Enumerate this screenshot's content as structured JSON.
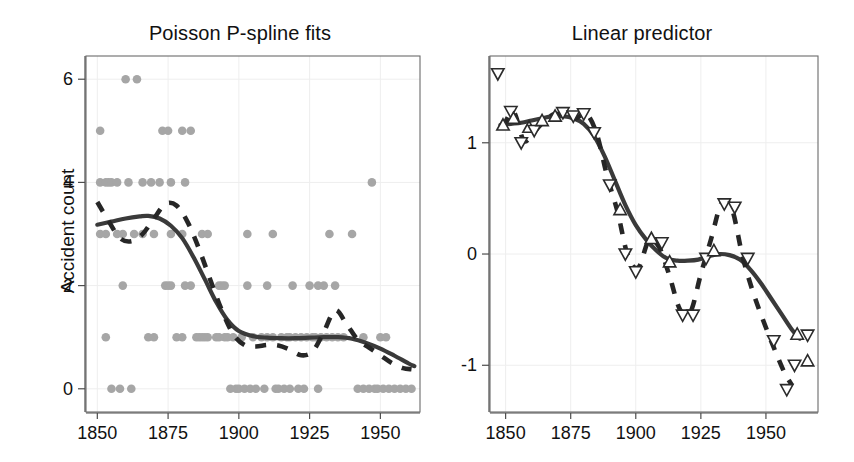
{
  "figure": {
    "background": "#ffffff",
    "dot_color": "#a6a6a6",
    "solid_color": "#3a3a3a",
    "dashed_color": "#262626",
    "grid_color": "#eeeeee"
  },
  "panels": [
    {
      "id": "left",
      "title": "Poisson P-spline fits",
      "ylabel": "Accident count",
      "xlabel": "",
      "xticks": [
        1850,
        1875,
        1900,
        1925,
        1950
      ],
      "yticks": [
        0,
        2,
        4,
        6
      ],
      "xlim": [
        1846,
        1964
      ],
      "ylim": [
        -0.45,
        6.45
      ]
    },
    {
      "id": "right",
      "title": "Linear predictor",
      "ylabel": "",
      "xlabel": "",
      "xticks": [
        1850,
        1875,
        1900,
        1925,
        1950
      ],
      "yticks": [
        -1,
        0,
        1
      ],
      "xlim": [
        1844,
        1970
      ],
      "ylim": [
        -1.42,
        1.78
      ]
    }
  ],
  "chart_data": [
    {
      "type": "scatter",
      "panel": "left",
      "title": "Poisson P-spline fits",
      "xlabel": "",
      "ylabel": "Accident count",
      "xlim": [
        1846,
        1964
      ],
      "ylim": [
        -0.45,
        6.45
      ],
      "xticks": [
        1850,
        1875,
        1900,
        1925,
        1950
      ],
      "yticks": [
        0,
        2,
        4,
        6
      ],
      "grid": true,
      "legend": "none",
      "points": [
        {
          "x": 1851,
          "y": 4
        },
        {
          "x": 1853,
          "y": 4
        },
        {
          "x": 1854,
          "y": 4
        },
        {
          "x": 1855,
          "y": 4
        },
        {
          "x": 1857,
          "y": 4
        },
        {
          "x": 1861,
          "y": 4
        },
        {
          "x": 1866,
          "y": 4
        },
        {
          "x": 1869,
          "y": 4
        },
        {
          "x": 1872,
          "y": 4
        },
        {
          "x": 1876,
          "y": 4
        },
        {
          "x": 1881,
          "y": 4
        },
        {
          "x": 1947,
          "y": 4
        },
        {
          "x": 1851,
          "y": 5
        },
        {
          "x": 1873,
          "y": 5
        },
        {
          "x": 1875,
          "y": 5
        },
        {
          "x": 1880,
          "y": 5
        },
        {
          "x": 1883,
          "y": 5
        },
        {
          "x": 1860,
          "y": 6
        },
        {
          "x": 1864,
          "y": 6
        },
        {
          "x": 1851,
          "y": 3
        },
        {
          "x": 1853,
          "y": 3
        },
        {
          "x": 1857,
          "y": 3
        },
        {
          "x": 1859,
          "y": 3
        },
        {
          "x": 1863,
          "y": 3
        },
        {
          "x": 1866,
          "y": 3
        },
        {
          "x": 1870,
          "y": 3
        },
        {
          "x": 1876,
          "y": 3
        },
        {
          "x": 1880,
          "y": 3
        },
        {
          "x": 1887,
          "y": 3
        },
        {
          "x": 1889,
          "y": 3
        },
        {
          "x": 1903,
          "y": 3
        },
        {
          "x": 1912,
          "y": 3
        },
        {
          "x": 1932,
          "y": 3
        },
        {
          "x": 1940,
          "y": 3
        },
        {
          "x": 1859,
          "y": 2
        },
        {
          "x": 1874,
          "y": 2
        },
        {
          "x": 1875,
          "y": 2
        },
        {
          "x": 1876,
          "y": 2
        },
        {
          "x": 1881,
          "y": 2
        },
        {
          "x": 1883,
          "y": 2
        },
        {
          "x": 1893,
          "y": 2
        },
        {
          "x": 1894,
          "y": 2
        },
        {
          "x": 1895,
          "y": 2
        },
        {
          "x": 1903,
          "y": 2
        },
        {
          "x": 1910,
          "y": 2
        },
        {
          "x": 1919,
          "y": 2
        },
        {
          "x": 1925,
          "y": 2
        },
        {
          "x": 1928,
          "y": 2
        },
        {
          "x": 1930,
          "y": 2
        },
        {
          "x": 1934,
          "y": 2
        },
        {
          "x": 1853,
          "y": 1
        },
        {
          "x": 1868,
          "y": 1
        },
        {
          "x": 1870,
          "y": 1
        },
        {
          "x": 1878,
          "y": 1
        },
        {
          "x": 1880,
          "y": 1
        },
        {
          "x": 1885,
          "y": 1
        },
        {
          "x": 1886,
          "y": 1
        },
        {
          "x": 1887,
          "y": 1
        },
        {
          "x": 1888,
          "y": 1
        },
        {
          "x": 1889,
          "y": 1
        },
        {
          "x": 1892,
          "y": 1
        },
        {
          "x": 1893,
          "y": 1
        },
        {
          "x": 1895,
          "y": 1
        },
        {
          "x": 1896,
          "y": 1
        },
        {
          "x": 1898,
          "y": 1
        },
        {
          "x": 1901,
          "y": 1
        },
        {
          "x": 1905,
          "y": 1
        },
        {
          "x": 1908,
          "y": 1
        },
        {
          "x": 1910,
          "y": 1
        },
        {
          "x": 1912,
          "y": 1
        },
        {
          "x": 1915,
          "y": 1
        },
        {
          "x": 1917,
          "y": 1
        },
        {
          "x": 1918,
          "y": 1
        },
        {
          "x": 1920,
          "y": 1
        },
        {
          "x": 1922,
          "y": 1
        },
        {
          "x": 1924,
          "y": 1
        },
        {
          "x": 1926,
          "y": 1
        },
        {
          "x": 1927,
          "y": 1
        },
        {
          "x": 1929,
          "y": 1
        },
        {
          "x": 1931,
          "y": 1
        },
        {
          "x": 1933,
          "y": 1
        },
        {
          "x": 1935,
          "y": 1
        },
        {
          "x": 1937,
          "y": 1
        },
        {
          "x": 1944,
          "y": 1
        },
        {
          "x": 1950,
          "y": 1
        },
        {
          "x": 1952,
          "y": 1
        },
        {
          "x": 1855,
          "y": 0
        },
        {
          "x": 1858,
          "y": 0
        },
        {
          "x": 1862,
          "y": 0
        },
        {
          "x": 1897,
          "y": 0
        },
        {
          "x": 1899,
          "y": 0
        },
        {
          "x": 1900,
          "y": 0
        },
        {
          "x": 1902,
          "y": 0
        },
        {
          "x": 1904,
          "y": 0
        },
        {
          "x": 1906,
          "y": 0
        },
        {
          "x": 1909,
          "y": 0
        },
        {
          "x": 1913,
          "y": 0
        },
        {
          "x": 1914,
          "y": 0
        },
        {
          "x": 1916,
          "y": 0
        },
        {
          "x": 1918,
          "y": 0
        },
        {
          "x": 1921,
          "y": 0
        },
        {
          "x": 1923,
          "y": 0
        },
        {
          "x": 1928,
          "y": 0
        },
        {
          "x": 1942,
          "y": 0
        },
        {
          "x": 1944,
          "y": 0
        },
        {
          "x": 1946,
          "y": 0
        },
        {
          "x": 1948,
          "y": 0
        },
        {
          "x": 1949,
          "y": 0
        },
        {
          "x": 1951,
          "y": 0
        },
        {
          "x": 1953,
          "y": 0
        },
        {
          "x": 1955,
          "y": 0
        },
        {
          "x": 1957,
          "y": 0
        },
        {
          "x": 1959,
          "y": 0
        },
        {
          "x": 1961,
          "y": 0
        }
      ],
      "series": [
        {
          "name": "solid-fit",
          "style": "solid",
          "x": [
            1850,
            1855,
            1860,
            1865,
            1868,
            1872,
            1876,
            1880,
            1884,
            1888,
            1892,
            1896,
            1900,
            1905,
            1910,
            1915,
            1920,
            1925,
            1930,
            1935,
            1940,
            1945,
            1950,
            1955,
            1960,
            1962
          ],
          "y": [
            3.18,
            3.24,
            3.3,
            3.34,
            3.35,
            3.3,
            3.16,
            2.92,
            2.55,
            2.12,
            1.68,
            1.33,
            1.12,
            1.02,
            0.99,
            0.98,
            0.98,
            0.99,
            1.0,
            1.0,
            0.97,
            0.89,
            0.78,
            0.64,
            0.49,
            0.44
          ]
        },
        {
          "name": "dashed-fit",
          "style": "dashed",
          "x": [
            1850,
            1854,
            1858,
            1862,
            1866,
            1870,
            1874,
            1878,
            1882,
            1886,
            1890,
            1894,
            1898,
            1902,
            1906,
            1910,
            1914,
            1918,
            1922,
            1926,
            1930,
            1934,
            1938,
            1942,
            1946,
            1950,
            1954,
            1958,
            1961
          ],
          "y": [
            3.62,
            3.25,
            2.92,
            2.86,
            3.0,
            3.3,
            3.58,
            3.55,
            3.22,
            2.7,
            2.1,
            1.52,
            1.06,
            0.85,
            0.82,
            0.85,
            0.84,
            0.76,
            0.65,
            0.72,
            1.1,
            1.52,
            1.26,
            0.95,
            0.8,
            0.65,
            0.5,
            0.4,
            0.38
          ]
        }
      ]
    },
    {
      "type": "scatter",
      "panel": "right",
      "title": "Linear predictor",
      "xlabel": "",
      "ylabel": "",
      "xlim": [
        1844,
        1970
      ],
      "ylim": [
        -1.42,
        1.78
      ],
      "xticks": [
        1850,
        1875,
        1900,
        1925,
        1950
      ],
      "yticks": [
        -1,
        0,
        1
      ],
      "grid": true,
      "legend": "none",
      "markers": [
        {
          "x": 1847,
          "y": 1.62,
          "shape": "triangle-down"
        },
        {
          "x": 1849,
          "y": 1.16,
          "shape": "triangle-up"
        },
        {
          "x": 1852,
          "y": 1.28,
          "shape": "triangle-down"
        },
        {
          "x": 1853,
          "y": 1.22,
          "shape": "triangle-up"
        },
        {
          "x": 1856,
          "y": 1.0,
          "shape": "triangle-down"
        },
        {
          "x": 1859,
          "y": 1.14,
          "shape": "triangle-up"
        },
        {
          "x": 1861,
          "y": 1.11,
          "shape": "triangle-down"
        },
        {
          "x": 1864,
          "y": 1.2,
          "shape": "triangle-up"
        },
        {
          "x": 1869,
          "y": 1.24,
          "shape": "triangle-up"
        },
        {
          "x": 1872,
          "y": 1.27,
          "shape": "triangle-down"
        },
        {
          "x": 1876,
          "y": 1.24,
          "shape": "triangle-down"
        },
        {
          "x": 1880,
          "y": 1.26,
          "shape": "triangle-down"
        },
        {
          "x": 1884,
          "y": 1.09,
          "shape": "triangle-down"
        },
        {
          "x": 1890,
          "y": 0.62,
          "shape": "triangle-down"
        },
        {
          "x": 1894,
          "y": 0.4,
          "shape": "triangle-up"
        },
        {
          "x": 1896,
          "y": 0.0,
          "shape": "triangle-down"
        },
        {
          "x": 1900,
          "y": -0.16,
          "shape": "triangle-down"
        },
        {
          "x": 1906,
          "y": 0.14,
          "shape": "triangle-up"
        },
        {
          "x": 1910,
          "y": 0.1,
          "shape": "triangle-down"
        },
        {
          "x": 1913,
          "y": -0.07,
          "shape": "triangle-up"
        },
        {
          "x": 1918,
          "y": -0.55,
          "shape": "triangle-down"
        },
        {
          "x": 1922,
          "y": -0.55,
          "shape": "triangle-down"
        },
        {
          "x": 1927,
          "y": -0.04,
          "shape": "triangle-down"
        },
        {
          "x": 1930,
          "y": 0.03,
          "shape": "triangle-up"
        },
        {
          "x": 1934,
          "y": 0.45,
          "shape": "triangle-down"
        },
        {
          "x": 1938,
          "y": 0.42,
          "shape": "triangle-down"
        },
        {
          "x": 1943,
          "y": -0.04,
          "shape": "triangle-down"
        },
        {
          "x": 1953,
          "y": -0.78,
          "shape": "triangle-down"
        },
        {
          "x": 1958,
          "y": -1.22,
          "shape": "triangle-down"
        },
        {
          "x": 1961,
          "y": -1.0,
          "shape": "triangle-down"
        },
        {
          "x": 1962,
          "y": -0.72,
          "shape": "triangle-up"
        },
        {
          "x": 1966,
          "y": -0.73,
          "shape": "triangle-down"
        },
        {
          "x": 1966,
          "y": -0.96,
          "shape": "triangle-up"
        }
      ],
      "series": [
        {
          "name": "solid-fit",
          "style": "solid",
          "x": [
            1848,
            1852,
            1856,
            1860,
            1864,
            1868,
            1872,
            1876,
            1880,
            1884,
            1888,
            1892,
            1896,
            1900,
            1904,
            1908,
            1912,
            1916,
            1920,
            1924,
            1928,
            1932,
            1936,
            1940,
            1944,
            1948,
            1952,
            1956,
            1960,
            1963
          ],
          "y": [
            1.16,
            1.17,
            1.18,
            1.2,
            1.22,
            1.24,
            1.24,
            1.22,
            1.17,
            1.06,
            0.88,
            0.66,
            0.44,
            0.26,
            0.13,
            0.03,
            -0.04,
            -0.06,
            -0.06,
            -0.05,
            -0.02,
            0.0,
            -0.01,
            -0.05,
            -0.14,
            -0.26,
            -0.4,
            -0.54,
            -0.68,
            -0.76
          ]
        },
        {
          "name": "dashed-fit",
          "style": "dashed",
          "x": [
            1849,
            1853,
            1857,
            1861,
            1865,
            1869,
            1873,
            1877,
            1881,
            1885,
            1889,
            1893,
            1897,
            1901,
            1905,
            1909,
            1913,
            1917,
            1921,
            1925,
            1929,
            1933,
            1937,
            1941,
            1945,
            1949,
            1953,
            1957,
            1960
          ],
          "y": [
            1.14,
            1.28,
            1.02,
            1.1,
            1.2,
            1.26,
            1.24,
            1.22,
            1.26,
            1.08,
            0.7,
            0.38,
            -0.02,
            -0.12,
            0.12,
            0.06,
            -0.2,
            -0.5,
            -0.52,
            -0.18,
            0.14,
            0.46,
            0.4,
            -0.02,
            -0.34,
            -0.6,
            -0.84,
            -1.06,
            -1.18
          ]
        }
      ]
    }
  ]
}
